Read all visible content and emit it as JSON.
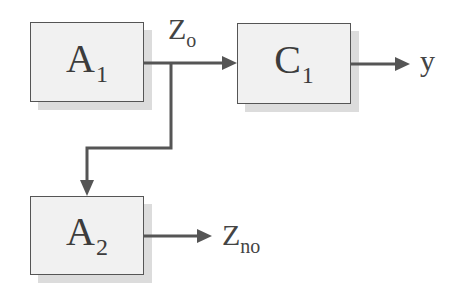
{
  "diagram": {
    "blocks": [
      {
        "id": "A1",
        "main": "A",
        "sub": "1"
      },
      {
        "id": "C1",
        "main": "C",
        "sub": "1"
      },
      {
        "id": "A2",
        "main": "A",
        "sub": "2"
      }
    ],
    "signals": [
      {
        "id": "zo",
        "main": "Z",
        "sub": "o"
      },
      {
        "id": "y",
        "main": "y",
        "sub": ""
      },
      {
        "id": "zno",
        "main": "Z",
        "sub": "no"
      }
    ],
    "edges": [
      {
        "from": "A1",
        "to": "C1",
        "label": "Zo"
      },
      {
        "from": "A1",
        "to": "A2",
        "label": "Zo (branch)"
      },
      {
        "from": "C1",
        "to": "output",
        "label": "y"
      },
      {
        "from": "A2",
        "to": "output",
        "label": "Zno"
      }
    ],
    "colors": {
      "block_fill": "#f1f1f1",
      "block_border": "#555555",
      "shadow": "#dcdcdc",
      "wire": "#555555"
    }
  }
}
